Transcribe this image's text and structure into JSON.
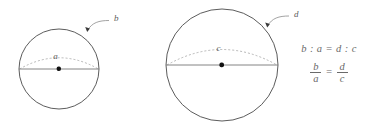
{
  "figure": {
    "background_color": "#ffffff",
    "stroke_color": "#4a4a4a",
    "dashed_color": "#9a9a9a",
    "label_color": "#5d5d5d",
    "small_sphere": {
      "name": "small-sphere",
      "center_x": 59,
      "center_y": 69,
      "radius": 40,
      "equator_label": "a",
      "leader_label": "b"
    },
    "large_sphere": {
      "name": "large-sphere",
      "center_x": 222,
      "center_y": 65,
      "radius": 56,
      "equator_label": "c",
      "leader_label": "d"
    },
    "formula": {
      "ratio": "b : a = d : c",
      "fraction_left_num": "b",
      "fraction_left_den": "a",
      "equals": "=",
      "fraction_right_num": "d",
      "fraction_right_den": "c"
    }
  }
}
